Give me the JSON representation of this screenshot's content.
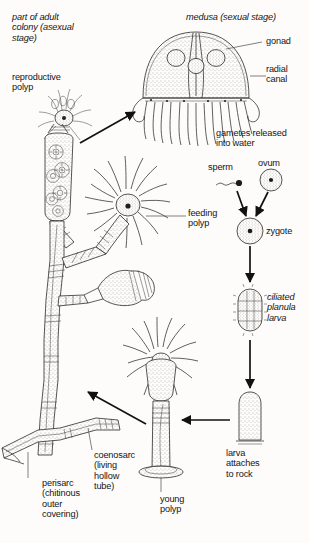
{
  "figure": {
    "background_color": "#fdfcfa",
    "ink_color": "#2b2b2b"
  },
  "labels": {
    "adult_colony": "part of adult\ncolony (asexual\nstage)",
    "reproductive_polyp": "reproductive\npolyp",
    "medusa": "medusa (sexual stage)",
    "gonad": "gonad",
    "radial_canal": "radial\ncanal",
    "gametes_released": "gametes released\ninto water",
    "sperm": "sperm",
    "ovum": "ovum",
    "zygote": "zygote",
    "planula": "ciliated\nplanula\nlarva",
    "feeding_polyp": "feeding\npolyp",
    "larva_attaches": "larva\nattaches\nto rock",
    "young_polyp": "young\npolyp",
    "coenosarc": "coenosarc\n(living\nhollow\ntube)",
    "perisarc": "perisarc\n(chitinous\nouter\ncovering)"
  },
  "structures": {
    "medusa_gonads": 3,
    "medusa_tentacles": 13,
    "feeding_polyp_tentacles": 16,
    "young_polyp_tentacles": 14,
    "gonangium_buds": 6
  },
  "stages": [
    {
      "id": "adult-colony",
      "label": "part of adult colony (asexual stage)"
    },
    {
      "id": "reproductive-polyp",
      "label": "reproductive polyp"
    },
    {
      "id": "medusa",
      "label": "medusa (sexual stage)"
    },
    {
      "id": "gametes",
      "label": "gametes released into water"
    },
    {
      "id": "sperm",
      "label": "sperm"
    },
    {
      "id": "ovum",
      "label": "ovum"
    },
    {
      "id": "zygote",
      "label": "zygote"
    },
    {
      "id": "planula",
      "label": "ciliated planula larva"
    },
    {
      "id": "attached-larva",
      "label": "larva attaches to rock"
    },
    {
      "id": "young-polyp",
      "label": "young polyp"
    }
  ]
}
